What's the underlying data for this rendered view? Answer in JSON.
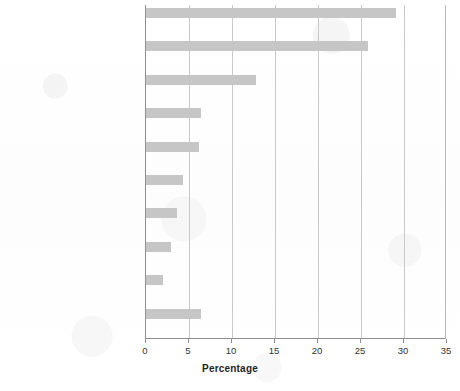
{
  "chart_data": {
    "type": "bar",
    "orientation": "horizontal",
    "title": "",
    "xlabel": "Percentage",
    "ylabel": "",
    "xlim": [
      0,
      35
    ],
    "xticks": [
      0,
      5,
      10,
      15,
      20,
      25,
      30,
      35
    ],
    "grid": true,
    "legend": null,
    "bar_color": "#c6c6c6",
    "categories": [
      "Cardiovascular diseases",
      "Infectious and parasitic diseases",
      "Malignant neoplasms",
      "Respiratory diseases",
      "Unintentional injuries",
      "Perinatal conditions",
      "Digestive diseases",
      "Intentional injuries",
      "Neuropsychiatric conditions",
      "Other"
    ],
    "values": [
      29.1,
      25.8,
      12.8,
      6.4,
      6.2,
      4.3,
      3.6,
      2.9,
      2.0,
      6.4
    ]
  }
}
